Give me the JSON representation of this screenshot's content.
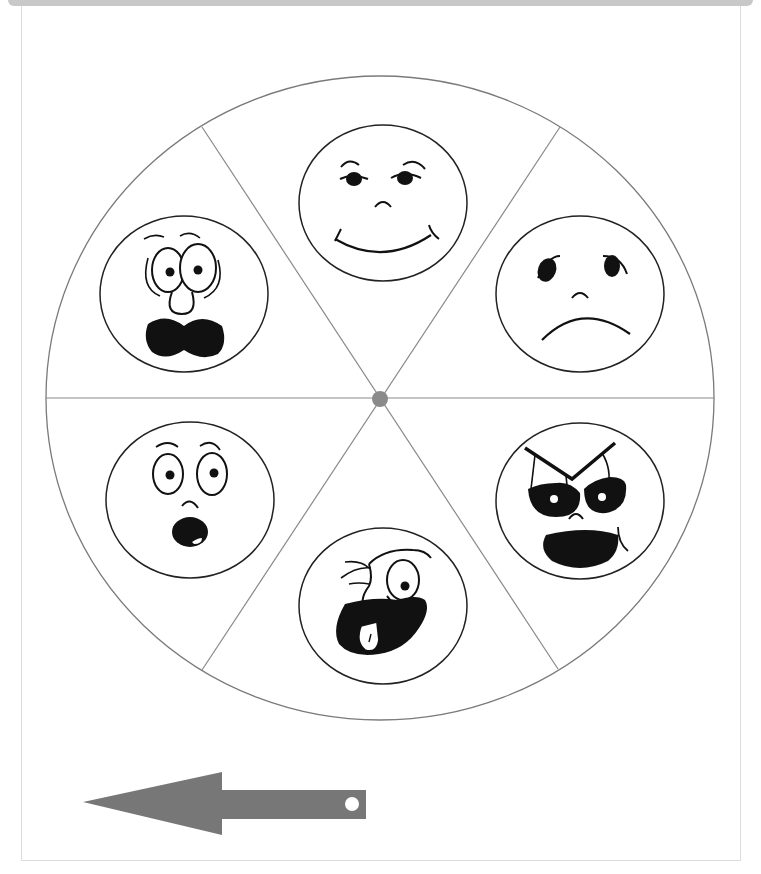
{
  "worksheet": {
    "title": "Emotions spinner",
    "wheel": {
      "segments": 6,
      "rim_color": "#7a7a7a",
      "hub_color": "#8a8a8a",
      "faces": [
        {
          "position": "top",
          "emotion": "happy"
        },
        {
          "position": "upper-right",
          "emotion": "sad"
        },
        {
          "position": "lower-right",
          "emotion": "angry"
        },
        {
          "position": "bottom",
          "emotion": "silly"
        },
        {
          "position": "lower-left",
          "emotion": "surprised"
        },
        {
          "position": "upper-left",
          "emotion": "scared"
        }
      ]
    },
    "pointer": {
      "shape": "arrow",
      "direction": "left",
      "color": "#777777"
    },
    "icons": {
      "happy": "happy-face-icon",
      "sad": "sad-face-icon",
      "angry": "angry-face-icon",
      "silly": "silly-face-icon",
      "surprised": "surprised-face-icon",
      "scared": "scared-face-icon",
      "spinner_arrow": "arrow-left-icon"
    }
  }
}
